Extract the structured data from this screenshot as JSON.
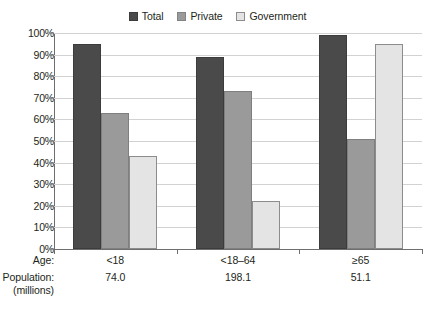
{
  "chart_data": {
    "type": "bar",
    "title": "",
    "subtitle": "",
    "xlabel": "",
    "ylabel": "",
    "ylim": [
      0,
      100
    ],
    "grid": true,
    "legend_position": "top-center",
    "categories": [
      "<18",
      "<18–64",
      "≥65"
    ],
    "series": [
      {
        "name": "Total",
        "color": "#4a4a4a",
        "values": [
          95,
          89,
          99
        ]
      },
      {
        "name": "Private",
        "color": "#9a9a9a",
        "values": [
          63,
          73,
          51
        ]
      },
      {
        "name": "Government",
        "color": "#e4e4e4",
        "values": [
          43,
          22,
          95
        ]
      }
    ],
    "ytick_labels": [
      "100%",
      "90%",
      "80%",
      "70%",
      "60%",
      "50%",
      "40%",
      "30%",
      "20%",
      "10%",
      "0%"
    ],
    "ytick_values": [
      100,
      90,
      80,
      70,
      60,
      50,
      40,
      30,
      20,
      10,
      0
    ],
    "row_headers": {
      "age": "Age:",
      "population_line1": "Population:",
      "population_line2": "(millions)"
    },
    "population_millions": [
      "74.0",
      "198.1",
      "51.1"
    ]
  },
  "legend": {
    "entries": [
      {
        "label": "Total",
        "swatch": "legend-swatch-total"
      },
      {
        "label": "Private",
        "swatch": "legend-swatch-private"
      },
      {
        "label": "Government",
        "swatch": "legend-swatch-government"
      }
    ]
  }
}
